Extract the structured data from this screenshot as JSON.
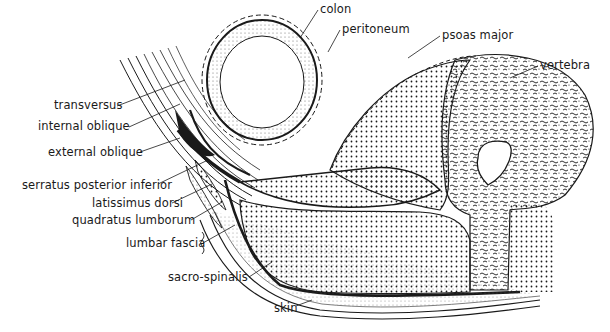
{
  "diagram": {
    "type": "anatomical cross-section",
    "colors": {
      "background": "#ffffff",
      "ink": "#1a1a1a"
    },
    "labels": [
      {
        "id": "colon",
        "text": "colon",
        "x": 320,
        "y": 4
      },
      {
        "id": "peritoneum",
        "text": "peritoneum",
        "x": 342,
        "y": 24
      },
      {
        "id": "psoas-major",
        "text": "psoas major",
        "x": 442,
        "y": 30
      },
      {
        "id": "vertebra",
        "text": "vertebra",
        "x": 540,
        "y": 60
      },
      {
        "id": "transversus",
        "text": "transversus",
        "x": 54,
        "y": 100
      },
      {
        "id": "internal-oblique",
        "text": "internal oblique",
        "x": 38,
        "y": 121
      },
      {
        "id": "external-oblique",
        "text": "external oblique",
        "x": 48,
        "y": 147
      },
      {
        "id": "serratus-posterior-inferior",
        "text": "serratus posterior inferior",
        "x": 22,
        "y": 180
      },
      {
        "id": "latissimus-dorsi",
        "text": "latissimus dorsi",
        "x": 92,
        "y": 198
      },
      {
        "id": "quadratus-lumborum",
        "text": "quadratus lumborum",
        "x": 72,
        "y": 215
      },
      {
        "id": "lumbar-fascia",
        "text": "lumbar fascia",
        "x": 126,
        "y": 238
      },
      {
        "id": "sacro-spinalis",
        "text": "sacro-spinalis",
        "x": 168,
        "y": 272
      },
      {
        "id": "skin",
        "text": "skin",
        "x": 274,
        "y": 303
      }
    ]
  }
}
